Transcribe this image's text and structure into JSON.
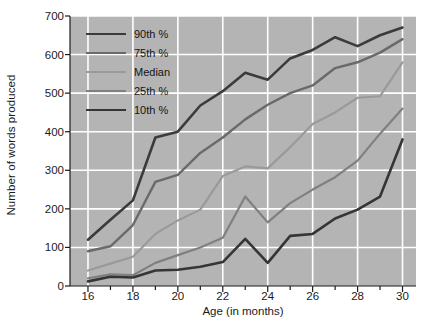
{
  "chart_data": {
    "type": "line",
    "title": "",
    "xlabel": "Age (in months)",
    "ylabel": "Number of words produced",
    "xlim": [
      15.2,
      30.6
    ],
    "ylim": [
      0,
      700
    ],
    "xticks": [
      16,
      17,
      18,
      19,
      20,
      21,
      22,
      23,
      24,
      25,
      26,
      27,
      28,
      29,
      30
    ],
    "xtick_labels": [
      "16",
      "",
      "18",
      "",
      "20",
      "",
      "22",
      "",
      "24",
      "",
      "26",
      "",
      "28",
      "",
      "30"
    ],
    "yticks": [
      0,
      100,
      200,
      300,
      400,
      500,
      600,
      700
    ],
    "ytick_labels": [
      "0",
      "100",
      "200",
      "300",
      "400",
      "500",
      "600",
      "700"
    ],
    "grid": true,
    "grid_color": "#ffffff",
    "plot_background": "#b4b4b4",
    "legend_position": "upper-left",
    "x": [
      16,
      17,
      18,
      19,
      20,
      21,
      22,
      23,
      24,
      25,
      26,
      27,
      28,
      29,
      30
    ],
    "series": [
      {
        "name": "90th %",
        "color": "#3b3b3b",
        "width": 2.6,
        "values": [
          120,
          172,
          222,
          385,
          400,
          468,
          505,
          553,
          535,
          590,
          612,
          645,
          622,
          650,
          670
        ]
      },
      {
        "name": "75th %",
        "color": "#6a6a6a",
        "width": 2.4,
        "values": [
          90,
          103,
          158,
          270,
          288,
          345,
          385,
          432,
          470,
          500,
          520,
          565,
          580,
          605,
          640
        ]
      },
      {
        "name": "Median",
        "color": "#9a9a9a",
        "width": 2.2,
        "values": [
          40,
          58,
          76,
          135,
          170,
          198,
          285,
          310,
          305,
          360,
          420,
          450,
          488,
          492,
          580
        ]
      },
      {
        "name": "25th %",
        "color": "#808080",
        "width": 2.2,
        "values": [
          20,
          30,
          28,
          60,
          80,
          100,
          125,
          232,
          165,
          215,
          250,
          282,
          325,
          395,
          460
        ]
      },
      {
        "name": "10th %",
        "color": "#353535",
        "width": 2.6,
        "values": [
          12,
          24,
          22,
          40,
          42,
          50,
          62,
          122,
          60,
          130,
          135,
          175,
          198,
          232,
          380
        ]
      }
    ]
  },
  "legend": {
    "items": [
      {
        "label": "90th %"
      },
      {
        "label": "75th %"
      },
      {
        "label": "Median"
      },
      {
        "label": "25th %"
      },
      {
        "label": "10th %"
      }
    ]
  }
}
